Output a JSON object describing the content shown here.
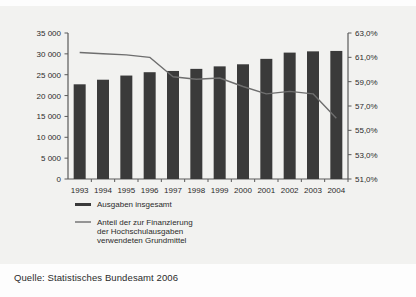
{
  "source_note": "Quelle: Statistisches Bundesamt 2006",
  "colors": {
    "bar": "#3a3a3a",
    "line": "#6e6e6e",
    "axis": "#5a5a5a",
    "text": "#2b2b2b",
    "panel_bg": "#f2f2f0",
    "page_bg": "#fdfdfd"
  },
  "legend": {
    "position": "bottom-left",
    "entries": [
      {
        "label": "Ausgaben insgesamt",
        "marker": "bar-swatch"
      },
      {
        "label_line1": "Anteil der zur Finanzierung",
        "label_line2": "der Hochschulausgaben",
        "label_line3": "verwendeten Grundmittel",
        "marker": "line-swatch"
      }
    ]
  },
  "chart_data": {
    "type": "bar",
    "title": "",
    "subtitle": "",
    "xlabel": "",
    "ylabel": "",
    "grid": false,
    "legend_position": "bottom-left",
    "categories": [
      "1993",
      "1994",
      "1995",
      "1996",
      "1997",
      "1998",
      "1999",
      "2000",
      "2001",
      "2002",
      "2003",
      "2004"
    ],
    "series": [
      {
        "name": "Ausgaben insgesamt",
        "type": "bar",
        "axis": "left",
        "unit": "Mio. EUR",
        "values": [
          22700,
          23800,
          24800,
          25600,
          25900,
          26400,
          27000,
          27500,
          28800,
          30300,
          30600,
          30700
        ]
      },
      {
        "name": "Anteil der zur Finanzierung der Hochschulausgaben verwendeten Grundmittel",
        "type": "line",
        "axis": "right",
        "unit": "%",
        "values": [
          61.4,
          61.3,
          61.2,
          61.0,
          59.4,
          59.2,
          59.3,
          58.6,
          58.0,
          58.2,
          58.0,
          56.0
        ]
      }
    ],
    "y_left": {
      "label": "",
      "min": 0,
      "max": 35000,
      "step": 5000,
      "ticks": [
        "0",
        "5 000",
        "10 000",
        "15 000",
        "20 000",
        "25 000",
        "30 000",
        "35 000"
      ]
    },
    "y_right": {
      "label": "",
      "min": 51.0,
      "max": 63.0,
      "step": 2.0,
      "ticks": [
        "51,0%",
        "53,0%",
        "55,0%",
        "57,0%",
        "59,0%",
        "61,0%",
        "63,0%"
      ]
    }
  }
}
